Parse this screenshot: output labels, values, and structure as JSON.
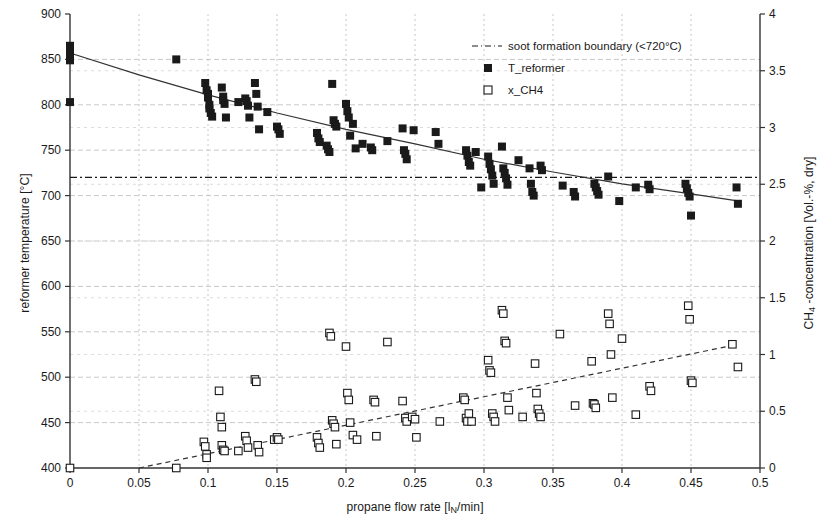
{
  "chart_data": {
    "type": "scatter",
    "title": "",
    "xlabel": "propane flow rate [lN/min]",
    "xlabel_parts": {
      "pre": "propane flow rate [l",
      "sub": "N",
      "post": "/min]"
    },
    "ylabel_left": "reformer temperature [°C]",
    "ylabel_right": "CH4 -concentration [Vol.-%, dry]",
    "ylabel_right_parts": {
      "pre": "CH",
      "sub": "4",
      "post": " -concentration [Vol.-%, dry]"
    },
    "xlim": [
      0,
      0.5
    ],
    "ylim_left": [
      400,
      900
    ],
    "ylim_right": [
      0,
      4
    ],
    "xticks": [
      "0",
      "0.05",
      "0.1",
      "0.15",
      "0.2",
      "0.25",
      "0.3",
      "0.35",
      "0.4",
      "0.45",
      "0.5"
    ],
    "xtick_values": [
      0,
      0.05,
      0.1,
      0.15,
      0.2,
      0.25,
      0.3,
      0.35,
      0.4,
      0.45,
      0.5
    ],
    "yticks_left": [
      "400",
      "450",
      "500",
      "550",
      "600",
      "650",
      "700",
      "750",
      "800",
      "850",
      "900"
    ],
    "ytick_values_left": [
      400,
      450,
      500,
      550,
      600,
      650,
      700,
      750,
      800,
      850,
      900
    ],
    "yticks_right": [
      "0",
      "0.5",
      "1",
      "1.5",
      "2",
      "2.5",
      "3",
      "3.5",
      "4"
    ],
    "ytick_values_right": [
      0,
      0.5,
      1,
      1.5,
      2,
      2.5,
      3,
      3.5,
      4
    ],
    "grid": true,
    "grid_color": "#c8c8c8",
    "legend_position": "top-right",
    "legend": [
      {
        "label": "soot formation boundary (<720°C)",
        "marker": "dashdot-line"
      },
      {
        "label": "T_reformer",
        "marker": "filled-square"
      },
      {
        "label": "x_CH4",
        "marker": "open-square"
      }
    ],
    "series": [
      {
        "name": "T_reformer",
        "marker": "filled-square",
        "color": "#1a1a1a",
        "axis": "left",
        "points": [
          [
            0.0,
            865
          ],
          [
            0.0,
            861
          ],
          [
            0.0,
            857
          ],
          [
            0.0,
            853
          ],
          [
            0.0,
            849
          ],
          [
            0.0,
            803
          ],
          [
            0.077,
            850
          ],
          [
            0.098,
            824
          ],
          [
            0.099,
            816
          ],
          [
            0.1,
            812
          ],
          [
            0.1,
            808
          ],
          [
            0.101,
            800
          ],
          [
            0.101,
            796
          ],
          [
            0.102,
            791
          ],
          [
            0.103,
            787
          ],
          [
            0.11,
            819
          ],
          [
            0.111,
            809
          ],
          [
            0.111,
            805
          ],
          [
            0.112,
            801
          ],
          [
            0.113,
            786
          ],
          [
            0.122,
            803
          ],
          [
            0.127,
            807
          ],
          [
            0.128,
            804
          ],
          [
            0.129,
            799
          ],
          [
            0.13,
            786
          ],
          [
            0.134,
            824
          ],
          [
            0.135,
            812
          ],
          [
            0.136,
            798
          ],
          [
            0.137,
            773
          ],
          [
            0.143,
            792
          ],
          [
            0.15,
            776
          ],
          [
            0.151,
            773
          ],
          [
            0.152,
            768
          ],
          [
            0.179,
            769
          ],
          [
            0.18,
            763
          ],
          [
            0.181,
            759
          ],
          [
            0.186,
            755
          ],
          [
            0.187,
            751
          ],
          [
            0.188,
            748
          ],
          [
            0.19,
            823
          ],
          [
            0.191,
            783
          ],
          [
            0.192,
            779
          ],
          [
            0.193,
            776
          ],
          [
            0.2,
            801
          ],
          [
            0.201,
            793
          ],
          [
            0.202,
            786
          ],
          [
            0.203,
            766
          ],
          [
            0.205,
            779
          ],
          [
            0.207,
            752
          ],
          [
            0.212,
            757
          ],
          [
            0.218,
            753
          ],
          [
            0.219,
            750
          ],
          [
            0.23,
            760
          ],
          [
            0.241,
            774
          ],
          [
            0.242,
            750
          ],
          [
            0.243,
            746
          ],
          [
            0.244,
            740
          ],
          [
            0.249,
            772
          ],
          [
            0.265,
            770
          ],
          [
            0.267,
            757
          ],
          [
            0.287,
            750
          ],
          [
            0.288,
            744
          ],
          [
            0.289,
            737
          ],
          [
            0.29,
            733
          ],
          [
            0.294,
            748
          ],
          [
            0.298,
            709
          ],
          [
            0.303,
            743
          ],
          [
            0.304,
            735
          ],
          [
            0.305,
            729
          ],
          [
            0.306,
            722
          ],
          [
            0.307,
            713
          ],
          [
            0.313,
            754
          ],
          [
            0.314,
            730
          ],
          [
            0.315,
            725
          ],
          [
            0.316,
            719
          ],
          [
            0.317,
            712
          ],
          [
            0.325,
            739
          ],
          [
            0.333,
            730
          ],
          [
            0.334,
            713
          ],
          [
            0.335,
            704
          ],
          [
            0.336,
            700
          ],
          [
            0.341,
            733
          ],
          [
            0.342,
            728
          ],
          [
            0.357,
            711
          ],
          [
            0.365,
            704
          ],
          [
            0.366,
            699
          ],
          [
            0.38,
            713
          ],
          [
            0.381,
            709
          ],
          [
            0.382,
            705
          ],
          [
            0.383,
            701
          ],
          [
            0.39,
            721
          ],
          [
            0.398,
            694
          ],
          [
            0.41,
            709
          ],
          [
            0.419,
            712
          ],
          [
            0.42,
            707
          ],
          [
            0.446,
            713
          ],
          [
            0.447,
            708
          ],
          [
            0.448,
            703
          ],
          [
            0.449,
            699
          ],
          [
            0.45,
            678
          ],
          [
            0.483,
            709
          ],
          [
            0.484,
            691
          ]
        ]
      },
      {
        "name": "x_CH4",
        "marker": "open-square",
        "color": "#1a1a1a",
        "axis": "right",
        "points": [
          [
            0.0,
            0.0
          ],
          [
            0.077,
            0.0
          ],
          [
            0.097,
            0.23
          ],
          [
            0.098,
            0.19
          ],
          [
            0.099,
            0.12
          ],
          [
            0.099,
            0.09
          ],
          [
            0.108,
            0.68
          ],
          [
            0.109,
            0.45
          ],
          [
            0.11,
            0.36
          ],
          [
            0.11,
            0.2
          ],
          [
            0.111,
            0.16
          ],
          [
            0.112,
            0.15
          ],
          [
            0.122,
            0.15
          ],
          [
            0.127,
            0.28
          ],
          [
            0.128,
            0.24
          ],
          [
            0.129,
            0.18
          ],
          [
            0.134,
            0.78
          ],
          [
            0.135,
            0.76
          ],
          [
            0.136,
            0.2
          ],
          [
            0.137,
            0.14
          ],
          [
            0.148,
            0.25
          ],
          [
            0.15,
            0.27
          ],
          [
            0.151,
            0.25
          ],
          [
            0.179,
            0.27
          ],
          [
            0.18,
            0.22
          ],
          [
            0.181,
            0.18
          ],
          [
            0.188,
            1.19
          ],
          [
            0.189,
            1.16
          ],
          [
            0.19,
            0.42
          ],
          [
            0.191,
            0.39
          ],
          [
            0.192,
            0.36
          ],
          [
            0.193,
            0.21
          ],
          [
            0.2,
            1.07
          ],
          [
            0.201,
            0.66
          ],
          [
            0.202,
            0.6
          ],
          [
            0.203,
            0.4
          ],
          [
            0.205,
            0.29
          ],
          [
            0.208,
            0.25
          ],
          [
            0.22,
            0.6
          ],
          [
            0.221,
            0.58
          ],
          [
            0.222,
            0.28
          ],
          [
            0.23,
            1.11
          ],
          [
            0.241,
            0.59
          ],
          [
            0.243,
            0.44
          ],
          [
            0.244,
            0.41
          ],
          [
            0.248,
            0.45
          ],
          [
            0.25,
            0.43
          ],
          [
            0.251,
            0.27
          ],
          [
            0.268,
            0.41
          ],
          [
            0.285,
            0.62
          ],
          [
            0.286,
            0.6
          ],
          [
            0.287,
            0.44
          ],
          [
            0.288,
            0.41
          ],
          [
            0.289,
            0.48
          ],
          [
            0.291,
            0.41
          ],
          [
            0.303,
            0.95
          ],
          [
            0.304,
            0.86
          ],
          [
            0.305,
            0.84
          ],
          [
            0.306,
            0.48
          ],
          [
            0.307,
            0.45
          ],
          [
            0.308,
            0.41
          ],
          [
            0.313,
            1.39
          ],
          [
            0.314,
            1.36
          ],
          [
            0.315,
            1.12
          ],
          [
            0.316,
            1.1
          ],
          [
            0.317,
            0.62
          ],
          [
            0.318,
            0.51
          ],
          [
            0.328,
            0.45
          ],
          [
            0.337,
            0.92
          ],
          [
            0.338,
            0.66
          ],
          [
            0.339,
            0.52
          ],
          [
            0.34,
            0.48
          ],
          [
            0.341,
            0.45
          ],
          [
            0.355,
            1.18
          ],
          [
            0.366,
            0.55
          ],
          [
            0.378,
            0.94
          ],
          [
            0.379,
            0.57
          ],
          [
            0.38,
            0.56
          ],
          [
            0.381,
            0.53
          ],
          [
            0.39,
            1.36
          ],
          [
            0.391,
            1.27
          ],
          [
            0.392,
            1.0
          ],
          [
            0.393,
            0.62
          ],
          [
            0.4,
            1.14
          ],
          [
            0.41,
            0.47
          ],
          [
            0.42,
            0.72
          ],
          [
            0.421,
            0.68
          ],
          [
            0.448,
            1.43
          ],
          [
            0.449,
            1.31
          ],
          [
            0.45,
            0.77
          ],
          [
            0.451,
            0.75
          ],
          [
            0.48,
            1.09
          ],
          [
            0.484,
            0.89
          ]
        ]
      }
    ],
    "trendlines": [
      {
        "name": "T_reformer trend",
        "style": "solid",
        "axis": "left",
        "points": [
          [
            0.0,
            857
          ],
          [
            0.05,
            833
          ],
          [
            0.1,
            811
          ],
          [
            0.15,
            791
          ],
          [
            0.2,
            773
          ],
          [
            0.25,
            757
          ],
          [
            0.3,
            740
          ],
          [
            0.35,
            726
          ],
          [
            0.4,
            713
          ],
          [
            0.45,
            702
          ],
          [
            0.485,
            694
          ]
        ]
      },
      {
        "name": "x_CH4 trend",
        "style": "dashed",
        "axis": "right",
        "points": [
          [
            0.05,
            0.0
          ],
          [
            0.48,
            1.08
          ]
        ]
      }
    ],
    "reference_lines": [
      {
        "name": "soot formation boundary",
        "style": "dashdot",
        "axis": "left",
        "value": 720
      }
    ]
  }
}
